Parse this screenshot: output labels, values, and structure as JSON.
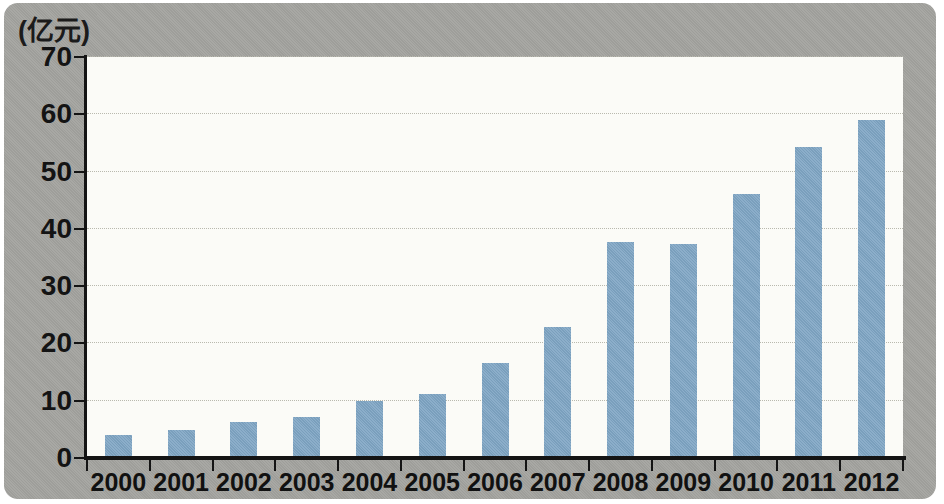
{
  "chart_data": {
    "type": "bar",
    "title": "",
    "subtitle": "",
    "xlabel": "",
    "ylabel": "(亿元)",
    "unit_label": "(亿元)",
    "categories": [
      "2000",
      "2001",
      "2002",
      "2003",
      "2004",
      "2005",
      "2006",
      "2007",
      "2008",
      "2009",
      "2010",
      "2011",
      "2012"
    ],
    "values": [
      4.1,
      4.9,
      6.3,
      7.1,
      9.9,
      11.2,
      16.6,
      22.8,
      37.7,
      37.4,
      46.0,
      54.3,
      59.0
    ],
    "ylim": [
      0,
      70
    ],
    "ytick_values": [
      0,
      10,
      20,
      30,
      40,
      50,
      60,
      70
    ],
    "ytick_labels": [
      "0",
      "10",
      "20",
      "30",
      "40",
      "50",
      "60",
      "70"
    ],
    "grid": true,
    "grid_axis": "y",
    "legend": false,
    "legend_position": "none",
    "series": [
      {
        "name": "",
        "values": [
          4.1,
          4.9,
          6.3,
          7.1,
          9.9,
          11.2,
          16.6,
          22.8,
          37.7,
          37.4,
          46.0,
          54.3,
          59.0
        ]
      }
    ]
  },
  "colors": {
    "bar": "#7fa5c4",
    "plot_background": "#fbfbf7",
    "panel_background": "#a3a39f",
    "axis": "#141414",
    "gridline": "#b9b9ae",
    "text": "#111111",
    "page_background": "#ffffff"
  }
}
